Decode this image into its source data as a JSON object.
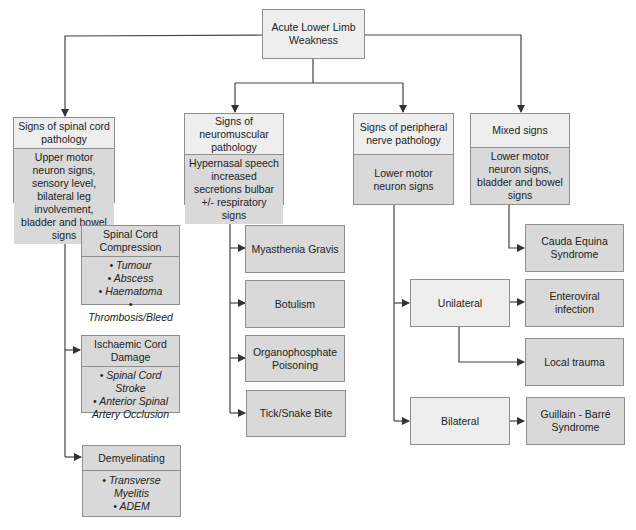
{
  "root": {
    "label": "Acute Lower Limb Weakness"
  },
  "categories": [
    {
      "title": "Signs of spinal cord pathology",
      "signs": "Upper motor neuron signs, sensory level, bilateral leg involvement, bladder and bowel signs"
    },
    {
      "title": "Signs of neuromuscular pathology",
      "signs": "Hypernasal speech increased secretions bulbar +/- respiratory signs"
    },
    {
      "title": "Signs of peripheral nerve pathology",
      "signs": "Lower motor neuron signs"
    },
    {
      "title": "Mixed signs",
      "signs": "Lower motor neuron signs, bladder and bowel signs"
    }
  ],
  "spinal": [
    {
      "title": "Spinal Cord Compression",
      "items": [
        "• Tumour",
        "• Abscess",
        "• Haematoma",
        "• Thrombosis/Bleed"
      ]
    },
    {
      "title": "Ischaemic Cord Damage",
      "items": [
        "• Spinal Cord Stroke",
        "• Anterior Spinal Artery Occlusion"
      ]
    },
    {
      "title": "Demyelinating",
      "items": [
        "• Transverse Myelitis",
        "• ADEM"
      ]
    }
  ],
  "neuromuscular": [
    "Myasthenia Gravis",
    "Botulism",
    "Organophosphate Poisoning",
    "Tick/Snake Bite"
  ],
  "peripheral": {
    "unilateral": {
      "label": "Unilateral",
      "outcomes": [
        "Enteroviral infection",
        "Local trauma"
      ]
    },
    "bilateral": {
      "label": "Bilateral",
      "outcomes": [
        "Guillain - Barré Syndrome"
      ]
    }
  },
  "mixed": [
    "Cauda Equina Syndrome"
  ],
  "colors": {
    "header_fill": "#eeeeee",
    "body_fill": "#d9d9d9",
    "border": "#8f8f8f",
    "line": "#333333"
  }
}
